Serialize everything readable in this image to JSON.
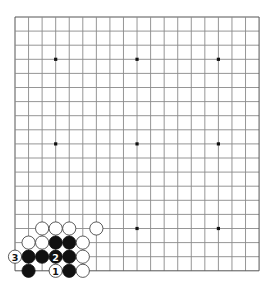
{
  "board": {
    "size": 19,
    "origin_x": 15,
    "origin_y": 17,
    "spacing_x": 13.56,
    "spacing_y": 14.1,
    "stone_radius": 6.6,
    "colors": {
      "background": "#ffffff",
      "grid": "#8a8a8a",
      "black_stone": "#111111",
      "white_stone": "#ffffff"
    },
    "hoshi": [
      [
        3,
        3
      ],
      [
        9,
        3
      ],
      [
        15,
        3
      ],
      [
        3,
        9
      ],
      [
        9,
        9
      ],
      [
        15,
        9
      ],
      [
        3,
        15
      ],
      [
        9,
        15
      ],
      [
        15,
        15
      ]
    ]
  },
  "stones": [
    {
      "col": 2,
      "row": 15,
      "color": "white",
      "label": ""
    },
    {
      "col": 3,
      "row": 15,
      "color": "white",
      "label": ""
    },
    {
      "col": 4,
      "row": 15,
      "color": "white",
      "label": ""
    },
    {
      "col": 6,
      "row": 15,
      "color": "white",
      "label": ""
    },
    {
      "col": 1,
      "row": 16,
      "color": "white",
      "label": ""
    },
    {
      "col": 2,
      "row": 16,
      "color": "white",
      "label": ""
    },
    {
      "col": 3,
      "row": 16,
      "color": "black",
      "label": ""
    },
    {
      "col": 4,
      "row": 16,
      "color": "black",
      "label": ""
    },
    {
      "col": 5,
      "row": 16,
      "color": "white",
      "label": ""
    },
    {
      "col": 0,
      "row": 17,
      "color": "white",
      "label": "3"
    },
    {
      "col": 1,
      "row": 17,
      "color": "black",
      "label": ""
    },
    {
      "col": 2,
      "row": 17,
      "color": "black",
      "label": ""
    },
    {
      "col": 3,
      "row": 17,
      "color": "black",
      "label": "2"
    },
    {
      "col": 4,
      "row": 17,
      "color": "black",
      "label": ""
    },
    {
      "col": 5,
      "row": 17,
      "color": "white",
      "label": ""
    },
    {
      "col": 1,
      "row": 18,
      "color": "black",
      "label": ""
    },
    {
      "col": 3,
      "row": 18,
      "color": "white",
      "label": "1"
    },
    {
      "col": 4,
      "row": 18,
      "color": "black",
      "label": ""
    },
    {
      "col": 5,
      "row": 18,
      "color": "white",
      "label": ""
    }
  ],
  "move_labels": [
    "1",
    "2",
    "3"
  ]
}
